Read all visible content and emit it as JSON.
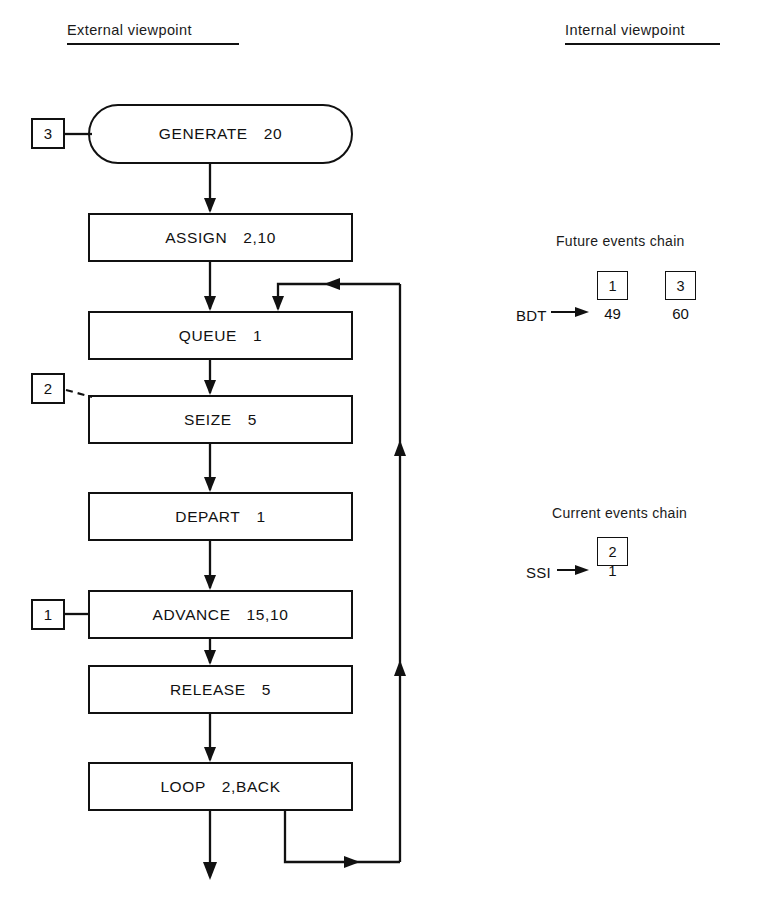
{
  "headings": {
    "external": "External viewpoint",
    "internal": "Internal viewpoint"
  },
  "flow": {
    "blocks": [
      {
        "op": "GENERATE",
        "operand": "20",
        "shape": "stadium"
      },
      {
        "op": "ASSIGN",
        "operand": "2,10",
        "shape": "rect"
      },
      {
        "op": "QUEUE",
        "operand": "1",
        "shape": "rect"
      },
      {
        "op": "SEIZE",
        "operand": "5",
        "shape": "rect"
      },
      {
        "op": "DEPART",
        "operand": "1",
        "shape": "rect"
      },
      {
        "op": "ADVANCE",
        "operand": "15,10",
        "shape": "rect"
      },
      {
        "op": "RELEASE",
        "operand": "5",
        "shape": "rect"
      },
      {
        "op": "LOOP",
        "operand": "2,BACK",
        "shape": "rect"
      }
    ],
    "tags": [
      {
        "label": "3",
        "attached_to": "GENERATE"
      },
      {
        "label": "2",
        "attached_to": "SEIZE"
      },
      {
        "label": "1",
        "attached_to": "ADVANCE"
      }
    ]
  },
  "future_events_chain": {
    "title": "Future events chain",
    "pointer_label": "BDT",
    "entries": [
      {
        "xact": "1",
        "value": "49"
      },
      {
        "xact": "3",
        "value": "60"
      }
    ]
  },
  "current_events_chain": {
    "title": "Current events chain",
    "pointer_label": "SSI",
    "entries": [
      {
        "xact": "2",
        "value": "1"
      }
    ]
  },
  "colors": {
    "ink": "#111111",
    "paper": "#ffffff"
  }
}
